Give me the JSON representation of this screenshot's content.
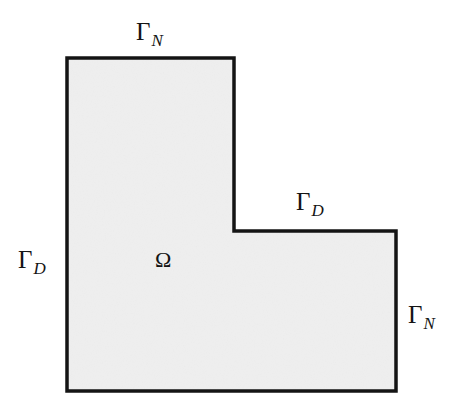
{
  "figure": {
    "domain_symbol": "Ω",
    "colors": {
      "background": "#ffffff",
      "fill": "#efefef",
      "stroke": "#141414",
      "text": "#141414"
    },
    "stroke_width_px": 3.5,
    "shape": {
      "type": "L-shape polygon",
      "points": [
        [
          67,
          58
        ],
        [
          234,
          58
        ],
        [
          234,
          231
        ],
        [
          396,
          231
        ],
        [
          396,
          391
        ],
        [
          67,
          391
        ]
      ]
    },
    "labels": [
      {
        "id": "top-gammaN",
        "gamma": "Γ",
        "subscript": "N",
        "boundary": "top edge of upper arm",
        "condition": "Neumann"
      },
      {
        "id": "inner-gammaD",
        "gamma": "Γ",
        "subscript": "D",
        "boundary": "inner horizontal edge of right arm",
        "condition": "Dirichlet"
      },
      {
        "id": "left-gammaD",
        "gamma": "Γ",
        "subscript": "D",
        "boundary": "left vertical edge",
        "condition": "Dirichlet"
      },
      {
        "id": "right-gammaN",
        "gamma": "Γ",
        "subscript": "N",
        "boundary": "right vertical edge",
        "condition": "Neumann"
      }
    ]
  }
}
